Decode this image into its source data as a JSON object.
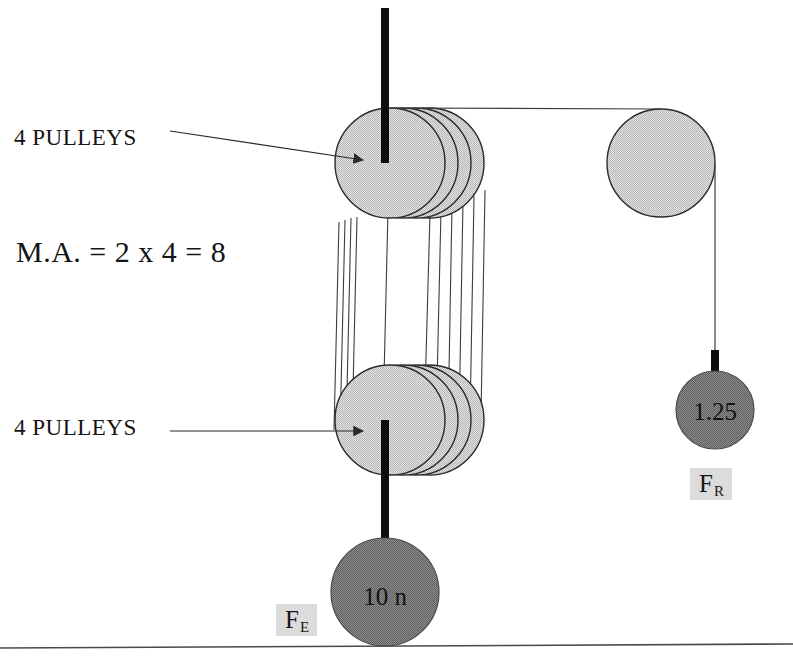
{
  "diagram": {
    "annotations": {
      "pulleys_top_label": "4 PULLEYS",
      "pulleys_bottom_label": "4 PULLEYS",
      "mechanical_advantage": "M.A. = 2 x 4 = 8"
    },
    "forces": {
      "effort": {
        "symbol": "F",
        "subscript": "E",
        "weight_label": "10 n"
      },
      "resistance": {
        "symbol": "F",
        "subscript": "R",
        "weight_label": "1.25"
      }
    },
    "components": {
      "top_block": {
        "name": "upper-pulley-block",
        "pulley_count": 4,
        "cx": 390,
        "cy": 163,
        "r": 55
      },
      "bottom_block": {
        "name": "lower-pulley-block",
        "pulley_count": 4,
        "cx": 390,
        "cy": 420,
        "r": 55
      },
      "side_pulley": {
        "name": "single-fixed-pulley",
        "pulley_count": 1,
        "cx": 661,
        "cy": 163,
        "r": 54
      },
      "effort_weight": {
        "name": "effort-weight",
        "cx": 385,
        "cy": 592,
        "r": 54
      },
      "resistance_weight": {
        "name": "resistance-weight",
        "cx": 715,
        "cy": 410,
        "r": 39
      }
    },
    "colors": {
      "pulley_fill": "#d2d2d2",
      "pulley_stroke": "#2b2b2b",
      "weight_fill": "#7f7f7f",
      "weight_stroke": "#4a4a4a",
      "support_bar": "#0d0d0d",
      "rope": "#3a3a3a",
      "ground_line": "#4a4a4a",
      "tag_background": "#dcdcdc"
    }
  }
}
